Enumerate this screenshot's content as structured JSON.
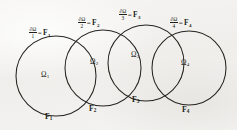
{
  "figure": {
    "kind": "mathematical-diagram",
    "background_color": "#f2f1ef",
    "stroke_color": "#26241f",
    "text_color": "#201e1a",
    "symbols": {
      "partial": "∂",
      "omega": "Ω",
      "equals": "="
    },
    "boundary_labels": [
      {
        "numerator": "∂Ω",
        "denominator": "1",
        "equals": "=",
        "rhs": "F",
        "rhs_sub": "1"
      },
      {
        "numerator": "∂Ω",
        "denominator": "2",
        "equals": "=",
        "rhs": "F",
        "rhs_sub": "2"
      },
      {
        "numerator": "∂Ω",
        "denominator": "3",
        "equals": "=",
        "rhs": "F",
        "rhs_sub": "3"
      },
      {
        "numerator": "∂Ω",
        "denominator": "4",
        "equals": "=",
        "rhs": "F",
        "rhs_sub": "4"
      }
    ],
    "domain_labels": [
      {
        "base": "Ω",
        "sub": "1"
      },
      {
        "base": "Ω",
        "sub": "2"
      },
      {
        "base": "Ω",
        "sub": "3"
      },
      {
        "base": "Ω",
        "sub": "4"
      }
    ],
    "arc_labels": [
      {
        "base": "F",
        "sub": "1"
      },
      {
        "base": "F",
        "sub": "2"
      },
      {
        "base": "F",
        "sub": "3"
      },
      {
        "base": "F",
        "sub": "4"
      }
    ],
    "circles": [
      {
        "cx": 56,
        "cy": 76,
        "r": 40
      },
      {
        "cx": 103,
        "cy": 68,
        "r": 38
      },
      {
        "cx": 146,
        "cy": 63,
        "r": 38
      },
      {
        "cx": 189,
        "cy": 68,
        "r": 37
      }
    ]
  }
}
